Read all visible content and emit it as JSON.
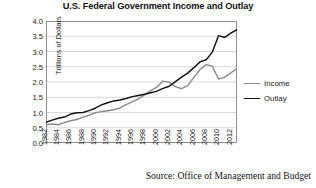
{
  "chart_data": {
    "type": "line",
    "title": "U.S. Federal Government Income and Outlay",
    "xlabel": "",
    "ylabel": "Trillions of Dollars",
    "ylim": [
      0.0,
      4.0
    ],
    "xlim": [
      1981,
      2012
    ],
    "grid": "horizontal",
    "legend_position": "right",
    "source": "Source: Office of Management and Budget",
    "ytick_labels": [
      "0.0",
      "0.5",
      "1.0",
      "1.5",
      "2.0",
      "2.5",
      "3.0",
      "3.5",
      "4.0"
    ],
    "ytick_values": [
      0.0,
      0.5,
      1.0,
      1.5,
      2.0,
      2.5,
      3.0,
      3.5,
      4.0
    ],
    "xtick_labels": [
      "1982",
      "1984",
      "1986",
      "1988",
      "1990",
      "1992",
      "1994",
      "1996",
      "1998",
      "2000",
      "2002",
      "2004",
      "2006",
      "2008",
      "2010",
      "2012"
    ],
    "xtick_values": [
      1982,
      1984,
      1986,
      1988,
      1990,
      1992,
      1994,
      1996,
      1998,
      2000,
      2002,
      2004,
      2006,
      2008,
      2010,
      2012
    ],
    "x": [
      1981,
      1982,
      1983,
      1984,
      1985,
      1986,
      1987,
      1988,
      1989,
      1990,
      1991,
      1992,
      1993,
      1994,
      1995,
      1996,
      1997,
      1998,
      1999,
      2000,
      2001,
      2002,
      2003,
      2004,
      2005,
      2006,
      2007,
      2008,
      2009,
      2010,
      2011,
      2012
    ],
    "series": [
      {
        "name": "Income",
        "color": "#8c8c8c",
        "values": [
          0.6,
          0.62,
          0.6,
          0.67,
          0.73,
          0.77,
          0.85,
          0.91,
          0.99,
          1.03,
          1.06,
          1.09,
          1.15,
          1.26,
          1.35,
          1.45,
          1.58,
          1.72,
          1.83,
          2.03,
          1.99,
          1.85,
          1.78,
          1.88,
          2.15,
          2.41,
          2.57,
          2.52,
          2.1,
          2.16,
          2.3,
          2.45
        ]
      },
      {
        "name": "Outlay",
        "color": "#121212",
        "values": [
          0.68,
          0.75,
          0.81,
          0.85,
          0.95,
          0.99,
          1.0,
          1.06,
          1.14,
          1.25,
          1.32,
          1.38,
          1.41,
          1.46,
          1.52,
          1.56,
          1.6,
          1.65,
          1.7,
          1.79,
          1.86,
          2.01,
          2.16,
          2.29,
          2.47,
          2.66,
          2.73,
          2.98,
          3.52,
          3.46,
          3.6,
          3.72
        ]
      }
    ]
  },
  "legend": {
    "items": [
      {
        "label": "Income",
        "color": "#8c8c8c"
      },
      {
        "label": "Outlay",
        "color": "#121212"
      }
    ]
  }
}
